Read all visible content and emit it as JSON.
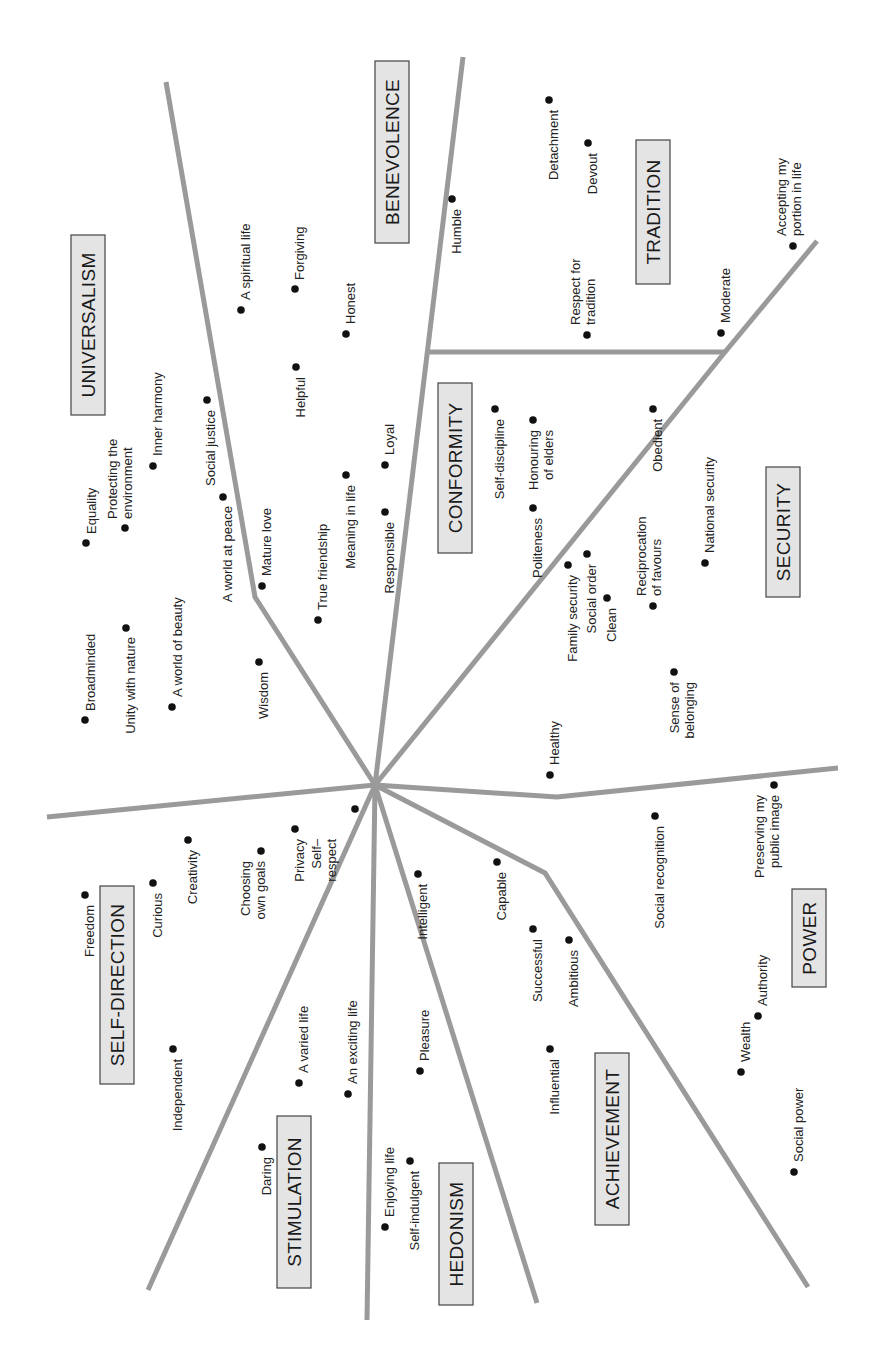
{
  "diagram": {
    "colors": {
      "line": "#9a9a9a",
      "dot": "#111111",
      "box_fill": "#e4e4e4",
      "box_stroke": "#444444"
    },
    "center": [
      375,
      785
    ],
    "dividers": [
      {
        "name": "universalism-benevolence",
        "points": [
          [
            375,
            785
          ],
          [
            255,
            597
          ],
          [
            166,
            82
          ]
        ]
      },
      {
        "name": "benevolence-conformity",
        "points": [
          [
            375,
            785
          ],
          [
            463,
            57
          ]
        ]
      },
      {
        "name": "conformity-security",
        "points": [
          [
            375,
            785
          ],
          [
            725,
            352
          ],
          [
            817,
            241
          ]
        ]
      },
      {
        "name": "tradition-conformity",
        "points": [
          [
            427,
            352
          ],
          [
            725,
            352
          ]
        ]
      },
      {
        "name": "security-power",
        "points": [
          [
            375,
            785
          ],
          [
            557,
            797
          ],
          [
            838,
            768
          ]
        ]
      },
      {
        "name": "achievement-power",
        "points": [
          [
            375,
            785
          ],
          [
            545,
            873
          ],
          [
            808,
            1287
          ]
        ]
      },
      {
        "name": "hedonism-achievement",
        "points": [
          [
            375,
            785
          ],
          [
            537,
            1303
          ]
        ]
      },
      {
        "name": "stimulation-hedonism",
        "points": [
          [
            375,
            785
          ],
          [
            367,
            1320
          ]
        ]
      },
      {
        "name": "self-direction-stimulation",
        "points": [
          [
            375,
            785
          ],
          [
            148,
            1290
          ]
        ]
      },
      {
        "name": "universalism-self-direction",
        "points": [
          [
            375,
            785
          ],
          [
            47,
            817
          ]
        ]
      }
    ],
    "groups": [
      {
        "label": "UNIVERSALISM",
        "x": 88,
        "y": 325,
        "w": 34,
        "h": 180
      },
      {
        "label": "BENEVOLENCE",
        "x": 392,
        "y": 152,
        "w": 34,
        "h": 182
      },
      {
        "label": "TRADITION",
        "x": 653,
        "y": 212,
        "w": 34,
        "h": 144
      },
      {
        "label": "CONFORMITY",
        "x": 455,
        "y": 468,
        "w": 34,
        "h": 170
      },
      {
        "label": "SECURITY",
        "x": 783,
        "y": 532,
        "w": 34,
        "h": 130
      },
      {
        "label": "SELF-DIRECTION",
        "x": 117,
        "y": 985,
        "w": 34,
        "h": 198
      },
      {
        "label": "STIMULATION",
        "x": 294,
        "y": 1202,
        "w": 34,
        "h": 172
      },
      {
        "label": "HEDONISM",
        "x": 456,
        "y": 1234,
        "w": 34,
        "h": 142
      },
      {
        "label": "ACHIEVEMENT",
        "x": 612,
        "y": 1139,
        "w": 34,
        "h": 172
      },
      {
        "label": "POWER",
        "x": 809,
        "y": 938,
        "w": 34,
        "h": 98
      }
    ],
    "values": [
      {
        "group": "UNIVERSALISM",
        "lines": [
          "Equality"
        ],
        "dot": [
          86,
          543
        ],
        "tx": 92,
        "ty": 534,
        "anchor": "start"
      },
      {
        "group": "UNIVERSALISM",
        "lines": [
          "Protecting the",
          "environment"
        ],
        "dot": [
          125,
          528
        ],
        "tx": 120,
        "ty": 519,
        "anchor": "start"
      },
      {
        "group": "UNIVERSALISM",
        "lines": [
          "Inner harmony"
        ],
        "dot": [
          153,
          466
        ],
        "tx": 158,
        "ty": 456,
        "anchor": "start"
      },
      {
        "group": "UNIVERSALISM",
        "lines": [
          "Broadminded"
        ],
        "dot": [
          85,
          720
        ],
        "tx": 91,
        "ty": 711,
        "anchor": "start"
      },
      {
        "group": "UNIVERSALISM",
        "lines": [
          "Unity with nature"
        ],
        "dot": [
          126,
          628
        ],
        "tx": 131,
        "ty": 637,
        "anchor": "end"
      },
      {
        "group": "UNIVERSALISM",
        "lines": [
          "A world of beauty"
        ],
        "dot": [
          172,
          707
        ],
        "tx": 178,
        "ty": 697,
        "anchor": "start"
      },
      {
        "group": "UNIVERSALISM",
        "lines": [
          "Social justice"
        ],
        "dot": [
          207,
          400
        ],
        "tx": 211,
        "ty": 410,
        "anchor": "end"
      },
      {
        "group": "UNIVERSALISM",
        "lines": [
          "A world at peace"
        ],
        "dot": [
          223,
          497
        ],
        "tx": 228,
        "ty": 506,
        "anchor": "end"
      },
      {
        "group": "UNIVERSALISM",
        "lines": [
          "Wisdom"
        ],
        "dot": [
          259,
          662
        ],
        "tx": 264,
        "ty": 672,
        "anchor": "end"
      },
      {
        "group": "BENEVOLENCE",
        "lines": [
          "A spiritual life"
        ],
        "dot": [
          241,
          310
        ],
        "tx": 246,
        "ty": 300,
        "anchor": "start"
      },
      {
        "group": "BENEVOLENCE",
        "lines": [
          "Forgiving"
        ],
        "dot": [
          295,
          289
        ],
        "tx": 300,
        "ty": 280,
        "anchor": "start"
      },
      {
        "group": "BENEVOLENCE",
        "lines": [
          "Honest"
        ],
        "dot": [
          346,
          334
        ],
        "tx": 351,
        "ty": 324,
        "anchor": "start"
      },
      {
        "group": "BENEVOLENCE",
        "lines": [
          "Helpful"
        ],
        "dot": [
          296,
          367
        ],
        "tx": 301,
        "ty": 377,
        "anchor": "end"
      },
      {
        "group": "BENEVOLENCE",
        "lines": [
          "Mature love"
        ],
        "dot": [
          262,
          586
        ],
        "tx": 267,
        "ty": 576,
        "anchor": "start"
      },
      {
        "group": "BENEVOLENCE",
        "lines": [
          "True friendship"
        ],
        "dot": [
          318,
          620
        ],
        "tx": 323,
        "ty": 610,
        "anchor": "start"
      },
      {
        "group": "BENEVOLENCE",
        "lines": [
          "Meaning in life"
        ],
        "dot": [
          346,
          475
        ],
        "tx": 351,
        "ty": 485,
        "anchor": "end"
      },
      {
        "group": "BENEVOLENCE",
        "lines": [
          "Loyal"
        ],
        "dot": [
          385,
          465
        ],
        "tx": 390,
        "ty": 455,
        "anchor": "start"
      },
      {
        "group": "BENEVOLENCE",
        "lines": [
          "Responsible"
        ],
        "dot": [
          385,
          512
        ],
        "tx": 390,
        "ty": 522,
        "anchor": "end"
      },
      {
        "group": "BENEVOLENCE",
        "lines": [
          "Humble"
        ],
        "dot": [
          452,
          199
        ],
        "tx": 457,
        "ty": 209,
        "anchor": "end"
      },
      {
        "group": "TRADITION",
        "lines": [
          "Detachment"
        ],
        "dot": [
          549,
          100
        ],
        "tx": 554,
        "ty": 110,
        "anchor": "end"
      },
      {
        "group": "TRADITION",
        "lines": [
          "Devout"
        ],
        "dot": [
          588,
          143
        ],
        "tx": 593,
        "ty": 153,
        "anchor": "end"
      },
      {
        "group": "TRADITION",
        "lines": [
          "Respect for",
          "tradition"
        ],
        "dot": [
          587,
          335
        ],
        "tx": 583,
        "ty": 325,
        "anchor": "start"
      },
      {
        "group": "TRADITION",
        "lines": [
          "Moderate"
        ],
        "dot": [
          721,
          333
        ],
        "tx": 726,
        "ty": 323,
        "anchor": "start"
      },
      {
        "group": "TRADITION",
        "lines": [
          "Accepting my",
          "portion in life"
        ],
        "dot": [
          793,
          246
        ],
        "tx": 789,
        "ty": 236,
        "anchor": "start"
      },
      {
        "group": "CONFORMITY",
        "lines": [
          "Self-discipline"
        ],
        "dot": [
          495,
          409
        ],
        "tx": 500,
        "ty": 419,
        "anchor": "end"
      },
      {
        "group": "CONFORMITY",
        "lines": [
          "Honouring",
          "of elders"
        ],
        "dot": [
          533,
          420
        ],
        "tx": 541,
        "ty": 430,
        "anchor": "end"
      },
      {
        "group": "CONFORMITY",
        "lines": [
          "Obedient"
        ],
        "dot": [
          653,
          409
        ],
        "tx": 658,
        "ty": 419,
        "anchor": "end"
      },
      {
        "group": "CONFORMITY",
        "lines": [
          "Politeness"
        ],
        "dot": [
          533,
          508
        ],
        "tx": 538,
        "ty": 518,
        "anchor": "end"
      },
      {
        "group": "SECURITY",
        "lines": [
          "Family security"
        ],
        "dot": [
          568,
          565
        ],
        "tx": 573,
        "ty": 575,
        "anchor": "end"
      },
      {
        "group": "SECURITY",
        "lines": [
          "Social order"
        ],
        "dot": [
          587,
          554
        ],
        "tx": 592,
        "ty": 564,
        "anchor": "end"
      },
      {
        "group": "SECURITY",
        "lines": [
          "Clean"
        ],
        "dot": [
          607,
          598
        ],
        "tx": 612,
        "ty": 608,
        "anchor": "end"
      },
      {
        "group": "SECURITY",
        "lines": [
          "Reciprocation",
          "of favours"
        ],
        "dot": [
          653,
          606
        ],
        "tx": 649,
        "ty": 596,
        "anchor": "start"
      },
      {
        "group": "SECURITY",
        "lines": [
          "National security"
        ],
        "dot": [
          705,
          563
        ],
        "tx": 710,
        "ty": 553,
        "anchor": "start"
      },
      {
        "group": "SECURITY",
        "lines": [
          "Sense of",
          "belonging"
        ],
        "dot": [
          674,
          672
        ],
        "tx": 682,
        "ty": 682,
        "anchor": "end"
      },
      {
        "group": "SECURITY",
        "lines": [
          "Healthy"
        ],
        "dot": [
          550,
          775
        ],
        "tx": 555,
        "ty": 765,
        "anchor": "start"
      },
      {
        "group": "SELF-DIRECTION",
        "lines": [
          "Freedom"
        ],
        "dot": [
          85,
          895
        ],
        "tx": 90,
        "ty": 905,
        "anchor": "end"
      },
      {
        "group": "SELF-DIRECTION",
        "lines": [
          "Curious"
        ],
        "dot": [
          153,
          883
        ],
        "tx": 158,
        "ty": 893,
        "anchor": "end"
      },
      {
        "group": "SELF-DIRECTION",
        "lines": [
          "Creativity"
        ],
        "dot": [
          188,
          840
        ],
        "tx": 193,
        "ty": 850,
        "anchor": "end"
      },
      {
        "group": "SELF-DIRECTION",
        "lines": [
          "Choosing",
          "own goals"
        ],
        "dot": [
          261,
          851
        ],
        "tx": 253,
        "ty": 861,
        "anchor": "end"
      },
      {
        "group": "SELF-DIRECTION",
        "lines": [
          "Privacy"
        ],
        "dot": [
          295,
          829
        ],
        "tx": 300,
        "ty": 839,
        "anchor": "end"
      },
      {
        "group": "SELF-DIRECTION",
        "lines": [
          "Self–",
          "respect"
        ],
        "dot": [
          355,
          809
        ],
        "tx": 324,
        "ty": 839,
        "anchor": "end"
      },
      {
        "group": "SELF-DIRECTION",
        "lines": [
          "Independent"
        ],
        "dot": [
          173,
          1049
        ],
        "tx": 178,
        "ty": 1059,
        "anchor": "end"
      },
      {
        "group": "STIMULATION",
        "lines": [
          "A varied life"
        ],
        "dot": [
          299,
          1083
        ],
        "tx": 304,
        "ty": 1073,
        "anchor": "start"
      },
      {
        "group": "STIMULATION",
        "lines": [
          "An exciting life"
        ],
        "dot": [
          348,
          1094
        ],
        "tx": 353,
        "ty": 1084,
        "anchor": "start"
      },
      {
        "group": "STIMULATION",
        "lines": [
          "Daring"
        ],
        "dot": [
          262,
          1147
        ],
        "tx": 267,
        "ty": 1157,
        "anchor": "end"
      },
      {
        "group": "HEDONISM",
        "lines": [
          "Pleasure"
        ],
        "dot": [
          420,
          1071
        ],
        "tx": 425,
        "ty": 1061,
        "anchor": "start"
      },
      {
        "group": "HEDONISM",
        "lines": [
          "Enjoying life"
        ],
        "dot": [
          385,
          1227
        ],
        "tx": 390,
        "ty": 1217,
        "anchor": "start"
      },
      {
        "group": "HEDONISM",
        "lines": [
          "Self-indulgent"
        ],
        "dot": [
          410,
          1161
        ],
        "tx": 415,
        "ty": 1171,
        "anchor": "end"
      },
      {
        "group": "ACHIEVEMENT",
        "lines": [
          "Intelligent"
        ],
        "dot": [
          418,
          874
        ],
        "tx": 423,
        "ty": 884,
        "anchor": "end"
      },
      {
        "group": "ACHIEVEMENT",
        "lines": [
          "Capable"
        ],
        "dot": [
          497,
          862
        ],
        "tx": 502,
        "ty": 872,
        "anchor": "end"
      },
      {
        "group": "ACHIEVEMENT",
        "lines": [
          "Successful"
        ],
        "dot": [
          533,
          929
        ],
        "tx": 538,
        "ty": 939,
        "anchor": "end"
      },
      {
        "group": "ACHIEVEMENT",
        "lines": [
          "Ambitious"
        ],
        "dot": [
          569,
          940
        ],
        "tx": 574,
        "ty": 950,
        "anchor": "end"
      },
      {
        "group": "ACHIEVEMENT",
        "lines": [
          "Influential"
        ],
        "dot": [
          550,
          1049
        ],
        "tx": 555,
        "ty": 1059,
        "anchor": "end"
      },
      {
        "group": "POWER",
        "lines": [
          "Social recognition"
        ],
        "dot": [
          655,
          816
        ],
        "tx": 660,
        "ty": 826,
        "anchor": "end"
      },
      {
        "group": "POWER",
        "lines": [
          "Preserving my",
          "public image"
        ],
        "dot": [
          774,
          785
        ],
        "tx": 767,
        "ty": 795,
        "anchor": "end"
      },
      {
        "group": "POWER",
        "lines": [
          "Authority"
        ],
        "dot": [
          758,
          1016
        ],
        "tx": 763,
        "ty": 1006,
        "anchor": "start"
      },
      {
        "group": "POWER",
        "lines": [
          "Wealth"
        ],
        "dot": [
          741,
          1072
        ],
        "tx": 746,
        "ty": 1062,
        "anchor": "start"
      },
      {
        "group": "POWER",
        "lines": [
          "Social power"
        ],
        "dot": [
          794,
          1172
        ],
        "tx": 799,
        "ty": 1162,
        "anchor": "start"
      }
    ]
  }
}
